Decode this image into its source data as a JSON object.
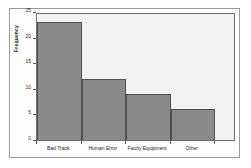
{
  "chart_data": {
    "type": "bar",
    "title": "",
    "subtitle": "",
    "xlabel": "",
    "ylabel": "Frequency",
    "categories": [
      "Bad Track",
      "Human Error",
      "Faulty Equipment",
      "Other"
    ],
    "values": [
      23,
      12,
      9,
      6
    ],
    "ylim": [
      0,
      25
    ],
    "yticks": [
      0,
      5,
      10,
      15,
      20,
      25
    ],
    "ytick_labels": [
      "0",
      "5",
      "10",
      "15",
      "20",
      "25"
    ],
    "grid": false,
    "legend": false,
    "bar_fill_color": "#8a8a8a",
    "bar_edge_color": "#4f4f4f",
    "plot_background_color": "#f2f2f2",
    "figure_background_color": "#ffffff",
    "axis_color": "#6e6e6e"
  }
}
